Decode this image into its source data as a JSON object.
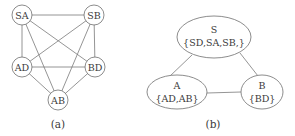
{
  "figure_a": {
    "caption": "(a)",
    "nodes": [
      {
        "id": "SA",
        "label": "SA",
        "x": 22,
        "y": 15
      },
      {
        "id": "SB",
        "label": "SB",
        "x": 94,
        "y": 15
      },
      {
        "id": "AD",
        "label": "AD",
        "x": 22,
        "y": 67
      },
      {
        "id": "BD",
        "label": "BD",
        "x": 95,
        "y": 67
      },
      {
        "id": "AB",
        "label": "AB",
        "x": 58,
        "y": 100
      }
    ],
    "edges": [
      [
        "SA",
        "SB"
      ],
      [
        "SA",
        "AD"
      ],
      [
        "SA",
        "BD"
      ],
      [
        "SA",
        "AB"
      ],
      [
        "SB",
        "AD"
      ],
      [
        "SB",
        "BD"
      ],
      [
        "SB",
        "AB"
      ],
      [
        "AD",
        "BD"
      ],
      [
        "AD",
        "AB"
      ],
      [
        "BD",
        "AB"
      ]
    ]
  },
  "figure_b": {
    "caption": "(b)",
    "nodes": [
      {
        "id": "S",
        "name": "S",
        "set": "{SD,SA,SB,}",
        "x": 214,
        "y": 37
      },
      {
        "id": "A",
        "name": "A",
        "set": "{AD,AB}",
        "x": 177,
        "y": 92
      },
      {
        "id": "B",
        "name": "B",
        "set": "{BD}",
        "x": 262,
        "y": 92
      }
    ],
    "edges": [
      [
        "S",
        "A"
      ],
      [
        "S",
        "B"
      ],
      [
        "A",
        "B"
      ]
    ]
  }
}
